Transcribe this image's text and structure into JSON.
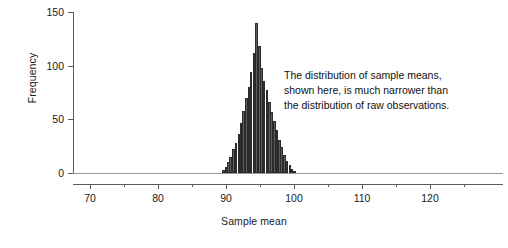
{
  "chart_data": {
    "type": "bar",
    "title": "",
    "subtitle": "",
    "xlabel": "Sample mean",
    "ylabel": "Frequency",
    "xlim": [
      66,
      127
    ],
    "ylim": [
      0,
      150
    ],
    "xticks": [
      70,
      80,
      90,
      100,
      110,
      120
    ],
    "xtick_labels": [
      "70",
      "80",
      "90",
      "100",
      "110",
      "120"
    ],
    "xminorticks": [
      75,
      85,
      95,
      105,
      115,
      125
    ],
    "yticks": [
      0,
      50,
      100,
      150
    ],
    "ytick_labels": [
      "0",
      "50",
      "100",
      "150"
    ],
    "grid": false,
    "legend": null,
    "bin_width": 0.375,
    "bar_color": "#5d5d5d",
    "bar_edge_color": "#2b2b2b",
    "axis_color": "#5a5a5a",
    "x": [
      89.6,
      90.0,
      90.4,
      90.7,
      91.1,
      91.5,
      91.9,
      92.2,
      92.6,
      93.0,
      93.4,
      93.7,
      94.1,
      94.5,
      94.9,
      95.2,
      95.6,
      96.0,
      96.4,
      96.7,
      97.1,
      97.5,
      97.9,
      98.2,
      98.6,
      99.0,
      99.4,
      99.7,
      100.1
    ],
    "values": [
      3,
      6,
      10,
      15,
      22,
      28,
      36,
      47,
      58,
      70,
      80,
      94,
      112,
      140,
      118,
      98,
      86,
      77,
      66,
      57,
      48,
      40,
      31,
      24,
      17,
      11,
      7,
      4,
      2
    ],
    "annotations": [
      {
        "lines": [
          "The distribution of sample means,",
          "shown here, is much narrower than",
          "the distribution of raw observations."
        ],
        "x": 101,
        "y": 105
      }
    ]
  },
  "axes": {
    "y_title": "Frequency",
    "x_title": "Sample mean"
  }
}
